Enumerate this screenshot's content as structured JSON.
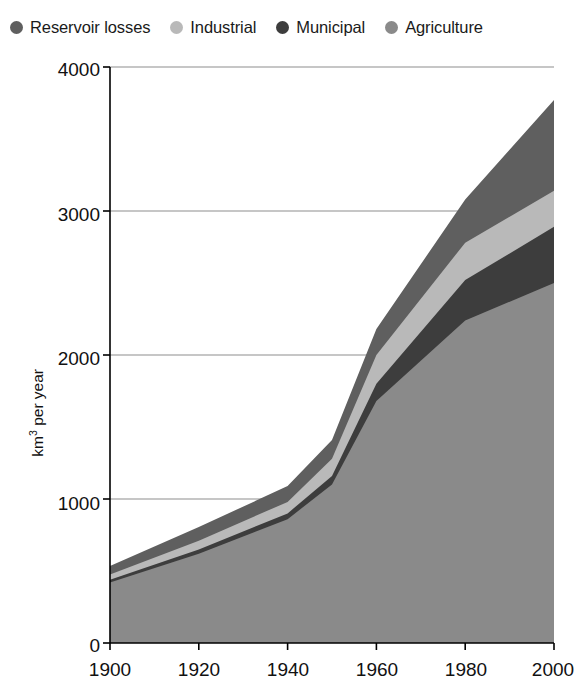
{
  "legend": {
    "items": [
      {
        "label": "Reservoir losses",
        "color": "#5f5f5f",
        "marker": "circle-marker"
      },
      {
        "label": "Industrial",
        "color": "#b9b9b9",
        "marker": "circle-marker"
      },
      {
        "label": "Municipal",
        "color": "#3d3d3d",
        "marker": "circle-marker"
      },
      {
        "label": "Agriculture",
        "color": "#8a8a8a",
        "marker": "circle-marker"
      }
    ]
  },
  "axes": {
    "y_label_html": "km3 per year",
    "y_label_prefix": "km",
    "y_label_sup": "3",
    "y_label_suffix": " per year",
    "y_ticks": [
      "0",
      "1000",
      "2000",
      "3000",
      "4000"
    ],
    "x_ticks": [
      "1900",
      "1920",
      "1940",
      "1960",
      "1980",
      "2000"
    ],
    "x_label": ""
  },
  "chart_data": {
    "type": "area",
    "title": "",
    "subtitle": "",
    "xlabel": "",
    "ylabel": "km3 per year",
    "xlim": [
      1900,
      2000
    ],
    "ylim": [
      0,
      4000
    ],
    "grid": true,
    "grid_axis": "y",
    "legend_position": "top",
    "stacked": true,
    "x": [
      1900,
      1920,
      1940,
      1950,
      1960,
      1980,
      2000
    ],
    "series": [
      {
        "name": "Agriculture",
        "color": "#8a8a8a",
        "values": [
          420,
          620,
          860,
          1100,
          1680,
          2240,
          2500
        ]
      },
      {
        "name": "Municipal",
        "color": "#3d3d3d",
        "values": [
          20,
          30,
          40,
          60,
          120,
          280,
          390
        ]
      },
      {
        "name": "Industrial",
        "color": "#b9b9b9",
        "values": [
          35,
          60,
          80,
          120,
          200,
          260,
          250
        ]
      },
      {
        "name": "Reservoir losses",
        "color": "#5f5f5f",
        "values": [
          60,
          95,
          110,
          130,
          180,
          300,
          630
        ]
      }
    ],
    "cumulative_tops": {
      "Agriculture": [
        420,
        620,
        860,
        1100,
        1680,
        2240,
        2500
      ],
      "Municipal": [
        440,
        650,
        900,
        1160,
        1800,
        2520,
        2890
      ],
      "Industrial": [
        475,
        710,
        980,
        1280,
        2000,
        2780,
        3140
      ],
      "Reservoir losses": [
        535,
        805,
        1090,
        1410,
        2180,
        3080,
        3770
      ]
    }
  },
  "colors": {
    "agriculture": "#8a8a8a",
    "municipal": "#3d3d3d",
    "industrial": "#b9b9b9",
    "reservoir_losses": "#5f5f5f",
    "grid": "#8d8d8d",
    "axis": "#000000",
    "background": "#ffffff",
    "text": "#111111"
  }
}
